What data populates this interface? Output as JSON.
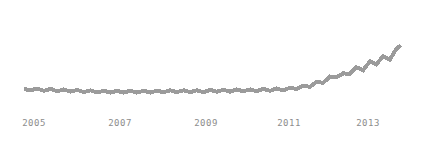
{
  "chart_data": {
    "type": "line",
    "title": "",
    "subtitle": "",
    "xlabel": "",
    "ylabel": "",
    "grid": false,
    "legend": false,
    "legend_position": "none",
    "axis_lines": false,
    "y_tick_labels": [],
    "xlim": [
      2004.7,
      2014.3
    ],
    "ylim": [
      0,
      100
    ],
    "x_tick_labels": [
      "2005",
      "2007",
      "2009",
      "2011",
      "2013"
    ],
    "x_tick_values": [
      2005,
      2007,
      2009,
      2011,
      2013
    ],
    "series": [
      {
        "name": "value",
        "color": "#9b9b9b",
        "x": [
          2004.75,
          2004.92,
          2005.08,
          2005.25,
          2005.42,
          2005.58,
          2005.75,
          2005.92,
          2006.08,
          2006.25,
          2006.42,
          2006.58,
          2006.75,
          2006.92,
          2007.08,
          2007.25,
          2007.42,
          2007.58,
          2007.75,
          2007.92,
          2008.08,
          2008.25,
          2008.42,
          2008.58,
          2008.75,
          2008.92,
          2009.08,
          2009.25,
          2009.42,
          2009.58,
          2009.75,
          2009.92,
          2010.08,
          2010.25,
          2010.42,
          2010.58,
          2010.75,
          2010.92,
          2011.08,
          2011.25,
          2011.42,
          2011.58,
          2011.75,
          2011.92,
          2012.08,
          2012.25,
          2012.42,
          2012.58,
          2012.75,
          2012.92,
          2013.08,
          2013.25,
          2013.42,
          2013.58,
          2013.75,
          2013.92,
          2014.08,
          2014.2
        ],
        "y": [
          9.0,
          7.5,
          9.5,
          7.0,
          9.0,
          6.5,
          8.5,
          6.0,
          8.0,
          5.5,
          7.5,
          5.0,
          7.0,
          5.0,
          7.0,
          5.0,
          7.0,
          5.0,
          7.0,
          5.0,
          7.0,
          5.5,
          7.5,
          5.5,
          7.5,
          5.5,
          7.5,
          5.5,
          8.0,
          6.0,
          8.0,
          6.0,
          8.5,
          6.5,
          8.5,
          6.5,
          9.0,
          7.0,
          9.5,
          7.5,
          10.5,
          9.0,
          12.5,
          11.5,
          17.0,
          16.0,
          23.0,
          22.0,
          26.5,
          26.0,
          33.5,
          30.0,
          40.0,
          36.5,
          46.0,
          42.0,
          54.0,
          58.0
        ]
      }
    ],
    "annotations": []
  },
  "axis": {
    "ticks": [
      {
        "label": "2005",
        "x_px": 34
      },
      {
        "label": "2007",
        "x_px": 120
      },
      {
        "label": "2009",
        "x_px": 206
      },
      {
        "label": "2011",
        "x_px": 289
      },
      {
        "label": "2013",
        "x_px": 368
      }
    ]
  },
  "style": {
    "line_color": "#9b9b9b",
    "label_color": "#8d8d8d",
    "background": "#ffffff"
  }
}
